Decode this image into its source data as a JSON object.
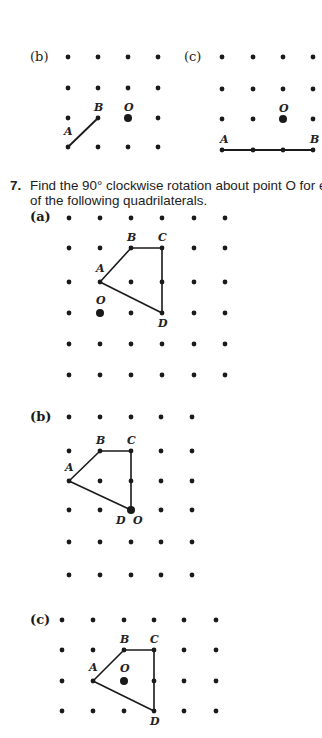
{
  "problem6": {
    "parts": [
      {
        "label": "(b)",
        "label_pos": [
          30,
          52
        ],
        "grid": {
          "cols": [
            68,
            98,
            128,
            158
          ],
          "rows": [
            57,
            88,
            118,
            147
          ]
        },
        "center": {
          "name": "O",
          "col": 2,
          "row": 2
        },
        "points": [
          {
            "name": "A",
            "col": 0,
            "row": 3,
            "label_dx": -4,
            "label_dy": -12
          },
          {
            "name": "B",
            "col": 1,
            "row": 2,
            "label_dx": -4,
            "label_dy": -7
          }
        ],
        "segments": [
          [
            "A",
            "B"
          ]
        ],
        "center_label_dy": -7
      },
      {
        "label": "(c)",
        "label_pos": [
          184,
          52
        ],
        "grid": {
          "cols": [
            222,
            253,
            283,
            313
          ],
          "rows": [
            57,
            89,
            119,
            150
          ]
        },
        "center": {
          "name": "O",
          "col": 2,
          "row": 2
        },
        "points": [
          {
            "name": "A",
            "col": 0,
            "row": 3,
            "label_dx": -2,
            "label_dy": -7
          },
          {
            "name": "B",
            "col": 3,
            "row": 3,
            "label_dx": -3,
            "label_dy": -7
          }
        ],
        "segments": [
          [
            "A",
            "B"
          ]
        ],
        "midpoints_on_segment": true,
        "center_label_dy": -7
      }
    ]
  },
  "problem7": {
    "number": "7.",
    "text_lines": [
      "Find the 90° clockwise rotation about point O for each",
      "of the following quadrilaterals."
    ],
    "parts": [
      {
        "label": "(a)",
        "label_pos": [
          30,
          212
        ],
        "grid": {
          "cols": [
            69,
            100,
            131,
            162,
            194,
            225
          ],
          "rows": [
            218,
            248,
            282,
            313,
            344,
            375
          ]
        },
        "center": {
          "name": "O",
          "col": 1,
          "row": 3
        },
        "points": [
          {
            "name": "A",
            "col": 1,
            "row": 2,
            "label_dx": -4,
            "label_dy": -10
          },
          {
            "name": "B",
            "col": 2,
            "row": 1,
            "label_dx": -4,
            "label_dy": -7
          },
          {
            "name": "C",
            "col": 3,
            "row": 1,
            "label_dx": -4,
            "label_dy": -7
          },
          {
            "name": "D",
            "col": 3,
            "row": 3,
            "label_dx": -4,
            "label_dy": 14
          }
        ],
        "polygon": [
          "A",
          "B",
          "C",
          "D"
        ],
        "center_label_dy": -9
      },
      {
        "label": "(b)",
        "label_pos": [
          30,
          412
        ],
        "grid": {
          "cols": [
            69,
            100,
            131,
            161,
            192
          ],
          "rows": [
            417,
            451,
            481,
            510,
            542,
            575
          ]
        },
        "center": {
          "name": "O",
          "col": 2,
          "row": 3
        },
        "points": [
          {
            "name": "A",
            "col": 0,
            "row": 2,
            "label_dx": -4,
            "label_dy": -10
          },
          {
            "name": "B",
            "col": 1,
            "row": 1,
            "label_dx": -4,
            "label_dy": -7
          },
          {
            "name": "C",
            "col": 2,
            "row": 1,
            "label_dx": -4,
            "label_dy": -7
          },
          {
            "name": "D",
            "col": 2,
            "row": 3,
            "label_dx": -15,
            "label_dy": 14
          }
        ],
        "polygon": [
          "A",
          "B",
          "C",
          "D"
        ],
        "center_label_dx": 6,
        "center_label_dy": 14
      },
      {
        "label": "(c)",
        "label_pos": [
          30,
          615
        ],
        "grid": {
          "cols": [
            62,
            93,
            124,
            154,
            184,
            216
          ],
          "rows": [
            620,
            650,
            681,
            711
          ]
        },
        "center": {
          "name": "O",
          "col": 2,
          "row": 2
        },
        "points": [
          {
            "name": "A",
            "col": 1,
            "row": 2,
            "label_dx": -4,
            "label_dy": -10
          },
          {
            "name": "B",
            "col": 2,
            "row": 1,
            "label_dx": -4,
            "label_dy": -7
          },
          {
            "name": "C",
            "col": 3,
            "row": 1,
            "label_dx": -4,
            "label_dy": -7
          },
          {
            "name": "D",
            "col": 3,
            "row": 3,
            "label_dx": -4,
            "label_dy": 14
          }
        ],
        "polygon": [
          "A",
          "B",
          "C",
          "D"
        ],
        "center_label_dy": -9
      }
    ]
  },
  "colors": {
    "ink": "#1a1a1a",
    "background": "#ffffff"
  }
}
